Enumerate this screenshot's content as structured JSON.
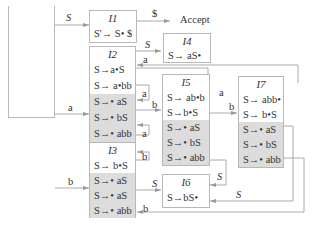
{
  "diagram": {
    "type": "LR(0) automaton",
    "accept_label": "Accept",
    "states": [
      {
        "id": "I0",
        "title": "I0",
        "kernel": [
          "S'→ • S $"
        ],
        "closure": [
          "S→• aS",
          "S→• bS",
          "S→• abb"
        ]
      },
      {
        "id": "I1",
        "title": "I1",
        "kernel": [
          "S'→ S• $"
        ],
        "closure": []
      },
      {
        "id": "I2",
        "title": "I2",
        "kernel": [
          "S→a•S",
          "S→ a•bb"
        ],
        "closure": [
          "S→• aS",
          "S→• bS",
          "S→• abb"
        ]
      },
      {
        "id": "I3",
        "title": "I3",
        "kernel": [
          "S→ b•S"
        ],
        "closure": [
          "S→• aS",
          "S→• aS",
          "S→• abb"
        ]
      },
      {
        "id": "I4",
        "title": "I4",
        "kernel": [
          "S→ aS•"
        ],
        "closure": []
      },
      {
        "id": "I5",
        "title": "I5",
        "kernel": [
          "S→ ab•b",
          "S→b•S"
        ],
        "closure": [
          "S→• aS",
          "S→• bS",
          "S→• abb"
        ]
      },
      {
        "id": "I6",
        "title": "I6",
        "kernel": [
          "S→bS•"
        ],
        "closure": []
      },
      {
        "id": "I7",
        "title": "I7",
        "kernel": [
          "S→ abb•",
          "S→ b•S"
        ],
        "closure": [
          "S→• aS",
          "S→• bS",
          "S→• abb"
        ]
      }
    ],
    "edges": [
      {
        "from": "I0",
        "to": "I1",
        "label": "S"
      },
      {
        "from": "I1",
        "to": "Accept",
        "label": "$"
      },
      {
        "from": "I0",
        "to": "I2",
        "label": "a"
      },
      {
        "from": "I0",
        "to": "I3",
        "label": "b"
      },
      {
        "from": "I2",
        "to": "I4",
        "label": "S"
      },
      {
        "from": "I2",
        "to": "I2",
        "label": "a"
      },
      {
        "from": "I2",
        "to": "I5",
        "label": "b"
      },
      {
        "from": "I3",
        "to": "I2",
        "label": "a"
      },
      {
        "from": "I3",
        "to": "I3",
        "label": "b"
      },
      {
        "from": "I3",
        "to": "I6",
        "label": "S"
      },
      {
        "from": "I5",
        "to": "I2",
        "label": "a"
      },
      {
        "from": "I5",
        "to": "I7",
        "label": "b"
      },
      {
        "from": "I5",
        "to": "I6",
        "label": "S"
      },
      {
        "from": "I7",
        "to": "I2",
        "label": "a"
      },
      {
        "from": "I7",
        "to": "I3",
        "label": "b"
      },
      {
        "from": "I7",
        "to": "I6",
        "label": "S"
      }
    ],
    "labels": {
      "S": "S",
      "dollar": "$",
      "a": "a",
      "b": "b"
    }
  }
}
